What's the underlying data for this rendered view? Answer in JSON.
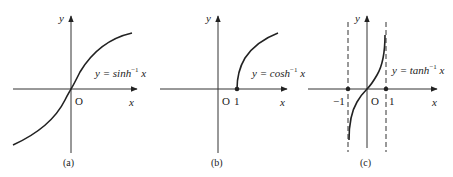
{
  "panels": [
    {
      "id": "a",
      "caption": "(a)",
      "equation": "y = sinh⁻¹ x",
      "eq_prefix": "y = sinh",
      "eq_sup": "−1",
      "eq_var": "x",
      "axis_x": "x",
      "axis_y": "y",
      "origin": "O"
    },
    {
      "id": "b",
      "caption": "(b)",
      "eq_prefix": "y = cosh",
      "eq_sup": "−1",
      "eq_var": "x",
      "axis_x": "x",
      "axis_y": "y",
      "origin": "O",
      "tick_1": "1"
    },
    {
      "id": "c",
      "caption": "(c)",
      "eq_prefix": "y = tanh",
      "eq_sup": "−1",
      "eq_var": "x",
      "axis_x": "x",
      "axis_y": "y",
      "origin": "O",
      "tick_neg1": "−1",
      "tick_1": "1"
    }
  ]
}
